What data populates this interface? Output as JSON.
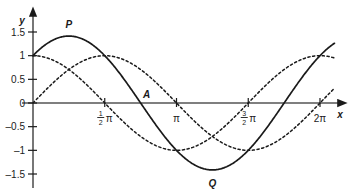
{
  "chart_data": {
    "type": "line",
    "title": "",
    "xlabel": "x",
    "ylabel": "y",
    "xlim": [
      -0.25,
      6.9
    ],
    "ylim": [
      -1.75,
      1.75
    ],
    "grid": false,
    "legend": "none",
    "x_ticks": [
      {
        "value": 1.5707963,
        "label": "½π",
        "num": "1",
        "den": "2",
        "suffix": "π"
      },
      {
        "value": 3.1415927,
        "label": "π",
        "num": "",
        "den": "",
        "suffix": "π"
      },
      {
        "value": 4.712389,
        "label": "3/2π",
        "num": "3",
        "den": "2",
        "suffix": "π"
      },
      {
        "value": 6.2831853,
        "label": "2π",
        "num": "",
        "den": "",
        "suffix": "2π"
      }
    ],
    "y_ticks": [
      {
        "value": 1.5,
        "label": "1.5"
      },
      {
        "value": 1.0,
        "label": "1"
      },
      {
        "value": 0.5,
        "label": "0.5"
      },
      {
        "value": 0.0,
        "label": "0"
      },
      {
        "value": -0.5,
        "label": "-0.5"
      },
      {
        "value": -1.0,
        "label": "-1"
      },
      {
        "value": -1.5,
        "label": "-1.5"
      }
    ],
    "series": [
      {
        "name": "sin x + cos x",
        "style": "solid",
        "color": "#1a1a1a",
        "formula": "sin(x)+cos(x)",
        "x_start": 0,
        "x_end": 6.6,
        "key_points": [
          {
            "x": 0,
            "y": 1
          },
          {
            "x": 0.7853982,
            "y": 1.4142
          },
          {
            "x": 2.3561945,
            "y": 0
          },
          {
            "x": 3.9269908,
            "y": -1.4142
          },
          {
            "x": 5.4977871,
            "y": 0
          },
          {
            "x": 6.6,
            "y": 1.29
          }
        ]
      },
      {
        "name": "cos x",
        "style": "dashed",
        "color": "#1a1a1a",
        "formula": "cos(x)",
        "x_start": 0,
        "x_end": 6.6,
        "key_points": [
          {
            "x": 0,
            "y": 1
          },
          {
            "x": 1.5707963,
            "y": 0
          },
          {
            "x": 3.1415927,
            "y": -1
          },
          {
            "x": 4.712389,
            "y": 0
          },
          {
            "x": 6.2831853,
            "y": 1
          },
          {
            "x": 6.6,
            "y": 0.88
          }
        ]
      },
      {
        "name": "sin x",
        "style": "dashed",
        "color": "#1a1a1a",
        "formula": "sin(x)",
        "x_start": 0,
        "x_end": 6.6,
        "key_points": [
          {
            "x": 0,
            "y": 0
          },
          {
            "x": 1.5707963,
            "y": 1
          },
          {
            "x": 3.1415927,
            "y": 0
          },
          {
            "x": 4.712389,
            "y": -1
          },
          {
            "x": 6.2831853,
            "y": 0
          },
          {
            "x": 6.6,
            "y": 0.32
          }
        ]
      }
    ],
    "annotations": [
      {
        "name": "P",
        "label": "P",
        "x": 0.7853982,
        "y": 1.4142,
        "role": "maximum"
      },
      {
        "name": "A",
        "label": "A",
        "x": 2.3561945,
        "y": 0,
        "role": "zero-crossing"
      },
      {
        "name": "Q",
        "label": "Q",
        "x": 3.9269908,
        "y": -1.4142,
        "role": "minimum"
      }
    ]
  },
  "axes": {
    "y_axis_label": "y",
    "x_axis_label": "x"
  }
}
